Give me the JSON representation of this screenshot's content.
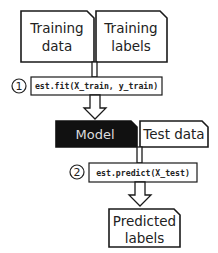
{
  "nodes": {
    "training_data": {
      "line1": "Training",
      "line2": "data"
    },
    "training_labels": {
      "line1": "Training",
      "line2": "labels"
    },
    "model": {
      "label": "Model"
    },
    "test_data": {
      "label": "Test data"
    },
    "predicted_labels": {
      "line1": "Predicted",
      "line2": "labels"
    }
  },
  "steps": [
    {
      "number": "1",
      "code": "est.fit(X_train, y_train)"
    },
    {
      "number": "2",
      "code": "est.predict(X_test)"
    }
  ],
  "colors": {
    "model_fill": "#111111",
    "outline": "#1a1a1a",
    "background": "#ffffff"
  }
}
